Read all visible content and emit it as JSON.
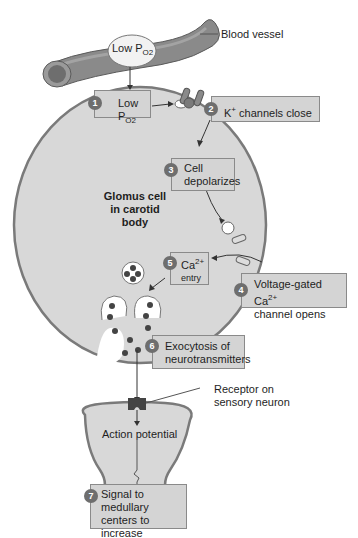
{
  "labels": {
    "blood_vessel": "Blood vessel",
    "vessel_low_po2": "Low P",
    "vessel_low_po2_sub": "O2",
    "glomus_line1": "Glomus cell",
    "glomus_line2": "in carotid",
    "glomus_line3": "body",
    "receptor_line1": "Receptor on",
    "receptor_line2": "sensory neuron",
    "action_potential": "Action potential"
  },
  "steps": [
    {
      "num": "1",
      "text": "Low P",
      "sub": "O2"
    },
    {
      "num": "2",
      "text": "K",
      "sup": "+",
      "text2": " channels close"
    },
    {
      "num": "3",
      "line1": "Cell",
      "line2": "depolarizes"
    },
    {
      "num": "4",
      "line1": "Voltage-gated Ca",
      "sup": "2+",
      "line2": "channel opens"
    },
    {
      "num": "5",
      "line1": "Ca",
      "sup": "2+",
      "line2": "entry"
    },
    {
      "num": "6",
      "line1": "Exocytosis of",
      "line2": "neurotransmitters"
    },
    {
      "num": "7",
      "line1": "Signal to medullary",
      "line2": "centers to increase",
      "line3": "ventilation"
    }
  ],
  "colors": {
    "cell_fill": "#d8d8d8",
    "cell_stroke": "#7a7a7a",
    "box_fill": "#d4d4d4",
    "step_badge": "#6e6e6e"
  }
}
